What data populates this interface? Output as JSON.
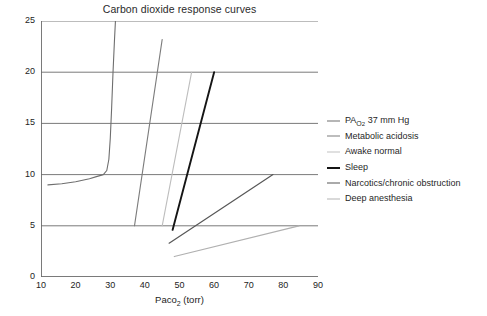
{
  "chart_data": {
    "type": "line",
    "title": "Carbon dioxide response curves",
    "xlabel": "Paco2 (torr)",
    "xlabel_base": "Paco",
    "xlabel_sub": "2",
    "xlabel_unit": " (torr)",
    "ylabel": "Alveolar ventilation (L/min)",
    "xlim": [
      10,
      90
    ],
    "ylim": [
      0,
      25
    ],
    "xticks": [
      10,
      20,
      30,
      40,
      50,
      60,
      70,
      80,
      90
    ],
    "yticks": [
      0,
      5,
      10,
      15,
      20,
      25
    ],
    "grid": "horizontal",
    "legend_position": "right",
    "series": [
      {
        "name": "PAO2 37 mm Hg",
        "label_base": "PA",
        "label_sub": "O",
        "label_sub2": "2",
        "label_rest": " 37 mm Hg",
        "color": "#6e6e6e",
        "width": 1.1,
        "points": [
          [
            12,
            9.0
          ],
          [
            16,
            9.1
          ],
          [
            20,
            9.3
          ],
          [
            24,
            9.6
          ],
          [
            26,
            9.8
          ],
          [
            28,
            10.0
          ],
          [
            29,
            10.4
          ],
          [
            29.6,
            11.5
          ],
          [
            30.0,
            13.5
          ],
          [
            30.4,
            16.5
          ],
          [
            30.8,
            20.0
          ],
          [
            31.2,
            23.0
          ],
          [
            31.5,
            25.0
          ]
        ]
      },
      {
        "name": "Metabolic acidosis",
        "color": "#7c7c7c",
        "width": 1.1,
        "points": [
          [
            37.0,
            5.0
          ],
          [
            43.6,
            20.0
          ],
          [
            45.0,
            23.2
          ]
        ]
      },
      {
        "name": "Awake normal",
        "color": "#bdbdbd",
        "width": 1.1,
        "points": [
          [
            45.0,
            5.0
          ],
          [
            53.5,
            20.0
          ]
        ]
      },
      {
        "name": "Sleep",
        "color": "#151515",
        "width": 1.9,
        "points": [
          [
            48.0,
            4.6
          ],
          [
            60.0,
            20.0
          ]
        ]
      },
      {
        "name": "Narcotics/chronic obstruction",
        "color": "#575757",
        "width": 1.2,
        "points": [
          [
            47.0,
            3.3
          ],
          [
            77.0,
            10.0
          ]
        ]
      },
      {
        "name": "Deep anesthesia",
        "color": "#b0b0b0",
        "width": 1.2,
        "points": [
          [
            48.5,
            2.0
          ],
          [
            84.5,
            5.0
          ]
        ]
      }
    ]
  },
  "legend": {
    "items": [
      {
        "label": "PAO2 37 mm Hg",
        "color": "#6e6e6e",
        "width": 1.3,
        "rich": true
      },
      {
        "label": "Metabolic acidosis",
        "color": "#7c7c7c",
        "width": 1.3,
        "rich": false
      },
      {
        "label": "Awake normal",
        "color": "#c2c2c2",
        "width": 1.3,
        "rich": false
      },
      {
        "label": "Sleep",
        "color": "#151515",
        "width": 2.2,
        "rich": false
      },
      {
        "label": "Narcotics/chronic obstruction",
        "color": "#575757",
        "width": 1.4,
        "rich": false
      },
      {
        "label": "Deep anesthesia",
        "color": "#b3b3b3",
        "width": 1.4,
        "rich": false
      }
    ]
  },
  "axes": {
    "frame_color": "#6b6b6b",
    "grid_color": "#6b6b6b"
  }
}
